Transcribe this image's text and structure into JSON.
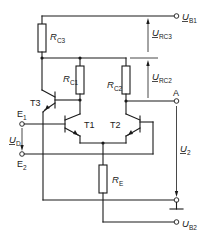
{
  "diagram": {
    "type": "differential amplifier with constant-current transistor",
    "colors": {
      "line": "#1a1a1a",
      "background": "#ffffff"
    },
    "supplies": {
      "ub1": {
        "symbol": "U",
        "subscript": "B1"
      },
      "ub2": {
        "symbol": "U",
        "subscript": "B2"
      }
    },
    "resistors": {
      "rc3": {
        "symbol": "R",
        "subscript": "C3"
      },
      "rc1": {
        "symbol": "R",
        "subscript": "C1"
      },
      "rc2": {
        "symbol": "R",
        "subscript": "C2"
      },
      "re": {
        "symbol": "R",
        "subscript": "E"
      }
    },
    "transistors": {
      "t1": "T1",
      "t2": "T2",
      "t3": "T3"
    },
    "terminals": {
      "e1": {
        "symbol": "E",
        "subscript": "1"
      },
      "e2": {
        "symbol": "E",
        "subscript": "2"
      },
      "a": "A"
    },
    "voltages": {
      "urc3": {
        "symbol": "U",
        "subscript": "RC3"
      },
      "urc2": {
        "symbol": "U",
        "subscript": "RC2"
      },
      "ud": {
        "symbol": "U",
        "subscript": "D"
      },
      "u2": {
        "symbol": "U",
        "subscript": "2"
      }
    }
  }
}
